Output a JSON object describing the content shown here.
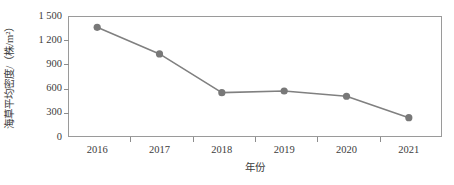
{
  "chart_data": {
    "type": "line",
    "title": "",
    "subtitle": "",
    "xlabel": "年份",
    "ylabel": "海草平均密度/（株/m²）",
    "categories": [
      "2016",
      "2017",
      "2018",
      "2019",
      "2020",
      "2021"
    ],
    "x": [
      2016,
      2017,
      2018,
      2019,
      2020,
      2021
    ],
    "series": [
      {
        "name": "海草平均密度",
        "values": [
          1360,
          1030,
          550,
          570,
          505,
          240
        ]
      }
    ],
    "ylim": [
      0,
      1500
    ],
    "yticks": [
      0,
      300,
      600,
      900,
      1200,
      1500
    ],
    "ytick_labels": [
      "0",
      "300",
      "600",
      "900",
      "1 200",
      "1 500"
    ],
    "xtick_labels": [
      "2016",
      "2017",
      "2018",
      "2019",
      "2020",
      "2021"
    ],
    "grid": false,
    "legend": false,
    "legend_position": "none",
    "marker": "circle",
    "line_color": "#808080",
    "marker_color": "#787878",
    "axis_color": "#9a9a9a",
    "text_color": "#3c3c3c",
    "background": "#ffffff"
  }
}
